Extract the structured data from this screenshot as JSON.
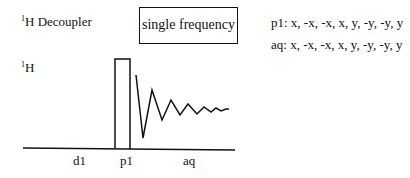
{
  "decoupler": {
    "nucleus_sup": "1",
    "label": "H Decoupler",
    "mode_box": "single frequency"
  },
  "observe": {
    "nucleus_sup": "1",
    "label": "H"
  },
  "phase_cycle": {
    "p1": "p1: x, -x, -x, x, y, -y, -y, y",
    "aq": "aq: x, -x, -x, x, y, -y, -y, y"
  },
  "timeline": {
    "labels": [
      "d1",
      "p1",
      "aq"
    ]
  },
  "colors": {
    "line": "#111111",
    "background": "#ffffff"
  }
}
